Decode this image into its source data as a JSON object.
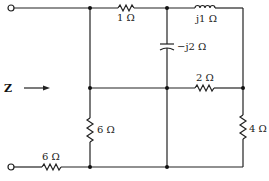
{
  "diagram": {
    "type": "circuit",
    "input_label": "Z",
    "components": [
      {
        "id": "r1",
        "kind": "resistor",
        "label": "1 Ω",
        "position": "top-wire left"
      },
      {
        "id": "l1",
        "kind": "inductor",
        "label": "j1 Ω",
        "position": "top-wire right"
      },
      {
        "id": "c1",
        "kind": "capacitor",
        "label": "−j2 Ω",
        "position": "vertical middle branch"
      },
      {
        "id": "r2",
        "kind": "resistor",
        "label": "2 Ω",
        "position": "middle wire"
      },
      {
        "id": "r4",
        "kind": "resistor",
        "label": "4 Ω",
        "position": "right vertical branch"
      },
      {
        "id": "r6v",
        "kind": "resistor",
        "label": "6 Ω",
        "position": "left vertical branch"
      },
      {
        "id": "r6h",
        "kind": "resistor",
        "label": "6 Ω",
        "position": "bottom wire"
      }
    ]
  }
}
